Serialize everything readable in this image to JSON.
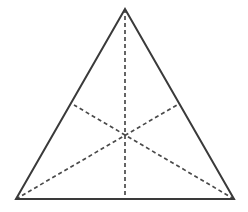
{
  "figure": {
    "type": "geometric-diagram",
    "canvas": {
      "width": 248,
      "height": 212,
      "background": "#ffffff"
    },
    "style": {
      "outline_color": "#3a3a3a",
      "outline_width": 2,
      "median_color": "#4a4a4a",
      "median_width": 1.7,
      "median_dash": "4 3",
      "fill_color": "#ffffff"
    },
    "vertices": [
      {
        "name": "apex",
        "label": "A",
        "x": 125,
        "y": 9
      },
      {
        "name": "bottom-left",
        "label": "B",
        "x": 16,
        "y": 199
      },
      {
        "name": "bottom-right",
        "label": "C",
        "x": 234,
        "y": 199
      }
    ],
    "midpoints": [
      {
        "name": "base-midpoint",
        "label": "Ma",
        "x": 125,
        "y": 199
      },
      {
        "name": "right-edge-midpoint",
        "label": "Mb",
        "x": 177,
        "y": 105
      },
      {
        "name": "left-edge-midpoint",
        "label": "Mc",
        "x": 74,
        "y": 105
      }
    ],
    "centroid": {
      "name": "centroid",
      "label": "G",
      "x": 125,
      "y": 136
    },
    "edges": [
      {
        "name": "left-edge",
        "from": "apex",
        "to": "bottom-left",
        "style": "solid"
      },
      {
        "name": "right-edge",
        "from": "apex",
        "to": "bottom-right",
        "style": "solid"
      },
      {
        "name": "base-edge",
        "from": "bottom-left",
        "to": "bottom-right",
        "style": "solid"
      }
    ],
    "medians": [
      {
        "name": "median-from-apex",
        "from": "apex",
        "to": "base-midpoint",
        "style": "dashed",
        "x1": 125,
        "y1": 9,
        "x2": 125,
        "y2": 199
      },
      {
        "name": "median-from-bottom-left",
        "from": "bottom-left",
        "to": "right-edge-midpoint",
        "style": "dashed",
        "x1": 16,
        "y1": 199,
        "x2": 177,
        "y2": 105
      },
      {
        "name": "median-from-bottom-right",
        "from": "bottom-right",
        "to": "left-edge-midpoint",
        "style": "dashed",
        "x1": 234,
        "y1": 199,
        "x2": 74,
        "y2": 105
      }
    ],
    "outline_path": "M 125 9 L 16 199 L 234 199 Z"
  }
}
